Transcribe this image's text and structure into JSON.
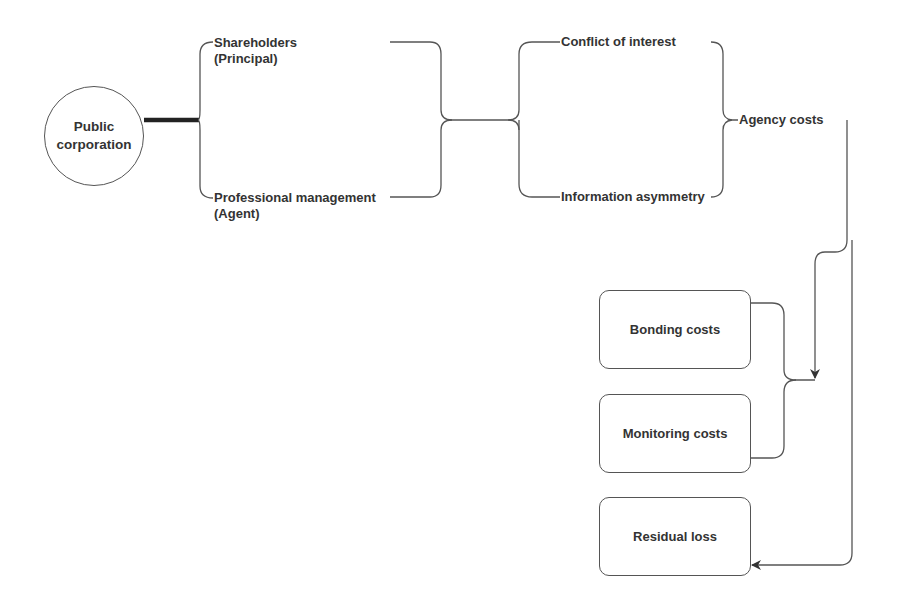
{
  "diagram": {
    "root": {
      "label": "Public\ncorporation"
    },
    "parties": {
      "principal": {
        "line1": "Shareholders",
        "line2": "(Principal)"
      },
      "agent": {
        "line1": "Professional management",
        "line2": "(Agent)"
      }
    },
    "problems": {
      "conflict": "Conflict of interest",
      "asymmetry": "Information asymmetry"
    },
    "result": "Agency costs",
    "cost_types": [
      {
        "label": "Bonding costs"
      },
      {
        "label": "Monitoring costs"
      },
      {
        "label": "Residual loss"
      }
    ],
    "colors": {
      "stroke": "#555555",
      "text": "#333333",
      "background": "#ffffff"
    }
  }
}
